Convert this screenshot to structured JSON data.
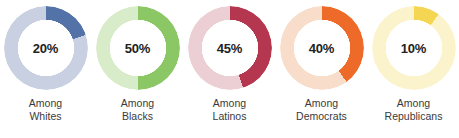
{
  "chart_data": {
    "type": "pie",
    "title": "",
    "subtitle": "",
    "xlabel": "",
    "ylabel": "",
    "legend_position": "none",
    "grid": false,
    "units": "percent",
    "categories": [
      "Among Whites",
      "Among Blacks",
      "Among Latinos",
      "Among Democrats",
      "Among Republicans"
    ],
    "values": [
      20,
      50,
      45,
      40,
      10
    ],
    "series": [
      {
        "name": "Share",
        "values": [
          20,
          50,
          45,
          40,
          10
        ]
      },
      {
        "name": "Remainder",
        "values": [
          80,
          50,
          55,
          60,
          90
        ]
      }
    ],
    "donuts": [
      {
        "id": "donut-whites",
        "value": 20,
        "value_label": "20%",
        "remainder": 80,
        "label_line1": "Among",
        "label_line2": "Whites",
        "fill_color": "#5372a8",
        "track_color": "#c9d0e1"
      },
      {
        "id": "donut-blacks",
        "value": 50,
        "value_label": "50%",
        "remainder": 50,
        "label_line1": "Among",
        "label_line2": "Blacks",
        "fill_color": "#8cc765",
        "track_color": "#d9ecc9"
      },
      {
        "id": "donut-latinos",
        "value": 45,
        "value_label": "45%",
        "remainder": 55,
        "label_line1": "Among",
        "label_line2": "Latinos",
        "fill_color": "#b5374f",
        "track_color": "#eccfd4"
      },
      {
        "id": "donut-democrats",
        "value": 40,
        "value_label": "40%",
        "remainder": 60,
        "label_line1": "Among",
        "label_line2": "Democrats",
        "fill_color": "#ee6a28",
        "track_color": "#f8ddcb"
      },
      {
        "id": "donut-republicans",
        "value": 10,
        "value_label": "10%",
        "remainder": 90,
        "label_line1": "Among",
        "label_line2": "Republicans",
        "fill_color": "#f4d653",
        "track_color": "#fbf3cc"
      }
    ]
  }
}
